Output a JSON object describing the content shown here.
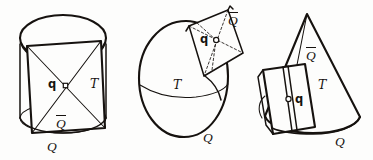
{
  "figure": {
    "caption": "",
    "background_color": "#fdfdfc",
    "ink_color": "#16120f",
    "panels": [
      {
        "id": "cylinder",
        "name": "cylinder-panel",
        "surface": "cylinder",
        "labels": {
          "point": "q",
          "patch": "Q̅",
          "tangent": "T",
          "base": "Q"
        }
      },
      {
        "id": "ovoid",
        "name": "ovoid-panel",
        "surface": "ovoid",
        "labels": {
          "point": "q",
          "patch": "Q̅",
          "tangent": "T",
          "base": "Q"
        }
      },
      {
        "id": "cone",
        "name": "cone-panel",
        "surface": "cone",
        "labels": {
          "point": "q",
          "patch": "Q̅",
          "tangent": "T",
          "base": "Q"
        }
      }
    ]
  },
  "labels": {
    "cyl_q": "q",
    "cyl_T": "T",
    "cyl_Qbar": "Q",
    "cyl_Q": "Q",
    "ov_q": "q",
    "ov_T": "T",
    "ov_Qbar": "Q",
    "ov_Q": "Q",
    "cone_q": "q",
    "cone_T": "T",
    "cone_Qbar": "Q",
    "cone_Q": "Q"
  }
}
